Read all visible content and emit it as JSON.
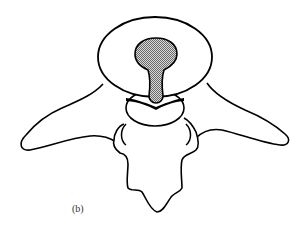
{
  "figure": {
    "panel_label": "(b)",
    "colors": {
      "stroke": "#000000",
      "background": "#ffffff",
      "shaded_region": "#b8b8b8"
    },
    "parts": [
      {
        "name": "vertebral-body",
        "shape": "oval"
      },
      {
        "name": "shaded-keyhole",
        "shape": "keyhole",
        "fill": "stippled gray"
      },
      {
        "name": "lower-ring",
        "shape": "half-oval"
      },
      {
        "name": "left-transverse-process",
        "shape": "wing"
      },
      {
        "name": "right-transverse-process",
        "shape": "wing"
      },
      {
        "name": "spinous-process",
        "shape": "pointed lobe"
      }
    ]
  }
}
